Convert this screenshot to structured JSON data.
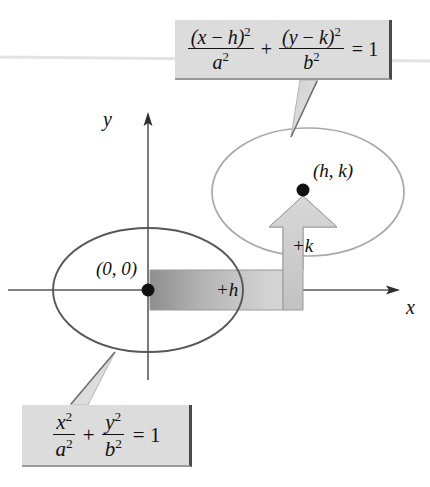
{
  "diagram": {
    "axes": {
      "x_label": "x",
      "y_label": "y",
      "origin_x": 148,
      "origin_y": 290
    },
    "points": [
      {
        "name": "origin-point",
        "label": "(0, 0)",
        "x": 148,
        "y": 290
      },
      {
        "name": "center-hk-point",
        "label": "(h, k)",
        "x": 303,
        "y": 190
      }
    ],
    "shift_labels": {
      "horizontal": "+h",
      "vertical": "+k"
    },
    "ellipses": [
      {
        "name": "ellipse-origin",
        "cx": 148,
        "cy": 290,
        "rx": 95,
        "ry": 62,
        "stroke": "#5a5a5a"
      },
      {
        "name": "ellipse-translated",
        "cx": 308,
        "cy": 192,
        "rx": 96,
        "ry": 64,
        "stroke": "#a8a8a8"
      }
    ],
    "colors": {
      "box_fill": "#dcdcdc",
      "box_border": "#4a4a4a",
      "arrow_fill": "#c9c9c9",
      "arrow_stroke": "#8f8f8f",
      "axis": "#5a5a5a",
      "ink": "#111111"
    }
  },
  "formula_translated": {
    "name": "translated-ellipse-equation",
    "term1_num_open": "(",
    "term1_num_var": "x",
    "term1_num_minus": " − ",
    "term1_num_param": "h",
    "term1_num_close": ")",
    "term1_num_exp": "2",
    "term1_den_var": "a",
    "term1_den_exp": "2",
    "plus": "+",
    "term2_num_open": "(",
    "term2_num_var": "y",
    "term2_num_minus": " − ",
    "term2_num_param": "k",
    "term2_num_close": ")",
    "term2_num_exp": "2",
    "term2_den_var": "b",
    "term2_den_exp": "2",
    "equals": "= 1",
    "plain": "(x − h)²/a² + (y − k)²/b² = 1"
  },
  "formula_standard": {
    "name": "standard-ellipse-equation",
    "term1_num_var": "x",
    "term1_num_exp": "2",
    "term1_den_var": "a",
    "term1_den_exp": "2",
    "plus": "+",
    "term2_num_var": "y",
    "term2_num_exp": "2",
    "term2_den_var": "b",
    "term2_den_exp": "2",
    "equals": "= 1",
    "plain": "x²/a² + y²/b² = 1"
  }
}
